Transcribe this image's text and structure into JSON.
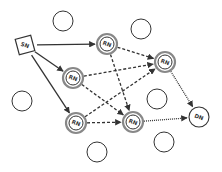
{
  "diagram": {
    "type": "network",
    "colors": {
      "stroke": "#333333",
      "ring": "#888888",
      "background": "#ffffff"
    },
    "nodes": [
      {
        "id": "sn",
        "label": "SN",
        "shape": "square",
        "x": 25,
        "y": 45
      },
      {
        "id": "rn1",
        "label": "RN",
        "shape": "double-circle",
        "x": 107,
        "y": 44
      },
      {
        "id": "rn2",
        "label": "RN",
        "shape": "double-circle",
        "x": 73,
        "y": 78
      },
      {
        "id": "rn3",
        "label": "RN",
        "shape": "double-circle",
        "x": 165,
        "y": 62
      },
      {
        "id": "rn4",
        "label": "RN",
        "shape": "double-circle",
        "x": 76,
        "y": 123
      },
      {
        "id": "rn5",
        "label": "RN",
        "shape": "double-circle",
        "x": 133,
        "y": 122
      },
      {
        "id": "dn",
        "label": "DN",
        "shape": "circle",
        "x": 199,
        "y": 117
      }
    ],
    "idle_nodes": [
      {
        "x": 63,
        "y": 21
      },
      {
        "x": 141,
        "y": 29
      },
      {
        "x": 22,
        "y": 101
      },
      {
        "x": 157,
        "y": 99
      },
      {
        "x": 97,
        "y": 152
      },
      {
        "x": 164,
        "y": 142
      }
    ],
    "edges": [
      {
        "from": "sn",
        "to": "rn1",
        "style": "solid"
      },
      {
        "from": "sn",
        "to": "rn2",
        "style": "solid"
      },
      {
        "from": "sn",
        "to": "rn4",
        "style": "solid"
      },
      {
        "from": "rn1",
        "to": "rn3",
        "style": "dashed"
      },
      {
        "from": "rn1",
        "to": "rn5",
        "style": "dashed"
      },
      {
        "from": "rn2",
        "to": "rn3",
        "style": "dashed"
      },
      {
        "from": "rn2",
        "to": "rn5",
        "style": "dashed"
      },
      {
        "from": "rn4",
        "to": "rn3",
        "style": "dashed"
      },
      {
        "from": "rn4",
        "to": "rn5",
        "style": "dashed"
      },
      {
        "from": "rn3",
        "to": "dn",
        "style": "dotted"
      },
      {
        "from": "rn5",
        "to": "dn",
        "style": "dotted"
      }
    ]
  }
}
